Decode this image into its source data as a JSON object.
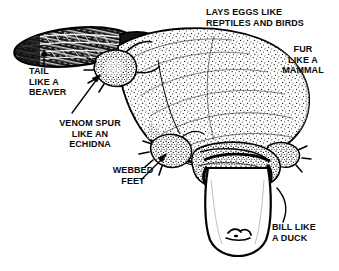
{
  "figure": {
    "view": "dorsal three-quarter view, head at lower right, tail at upper left",
    "style": "black and white stippled line drawing",
    "ink_color": "#000000",
    "background_color": "#ffffff"
  },
  "labels": [
    {
      "id": "lays-eggs",
      "name": "label-lays-eggs",
      "lines": [
        "LAYS EGGS LIKE",
        "REPTILES AND BIRDS"
      ],
      "text": "LAYS EGGS LIKE\nREPTILES AND BIRDS",
      "points_to": "body",
      "has_arrow": false
    },
    {
      "id": "fur",
      "name": "label-fur",
      "lines": [
        "FUR",
        "LIKE A",
        "MAMMAL"
      ],
      "text": "FUR\nLIKE A\nMAMMAL",
      "points_to": "body-fur",
      "has_arrow": false
    },
    {
      "id": "tail",
      "name": "label-tail",
      "lines": [
        "TAIL",
        "LIKE A",
        "BEAVER"
      ],
      "text": "TAIL\nLIKE A\nBEAVER",
      "points_to": "tail",
      "has_arrow": true
    },
    {
      "id": "venom-spur",
      "name": "label-venom-spur",
      "lines": [
        "VENOM SPUR",
        "LIKE AN",
        "ECHIDNA"
      ],
      "text": "VENOM SPUR\nLIKE AN\nECHIDNA",
      "points_to": "hind-limb-spur",
      "has_arrow": true
    },
    {
      "id": "webbed-feet",
      "name": "label-webbed-feet",
      "lines": [
        "WEBBED",
        "FEET"
      ],
      "text": "WEBBED\nFEET",
      "points_to": "front-foot",
      "has_arrow": true
    },
    {
      "id": "bill",
      "name": "label-bill",
      "lines": [
        "BILL LIKE",
        "A DUCK"
      ],
      "text": "BILL LIKE\nA DUCK",
      "points_to": "bill",
      "has_arrow": false
    }
  ],
  "anatomy_parts": [
    {
      "id": "tail",
      "label": "tail"
    },
    {
      "id": "body",
      "label": "body"
    },
    {
      "id": "hind-limb-spur",
      "label": "venom spur"
    },
    {
      "id": "front-foot",
      "label": "webbed foot"
    },
    {
      "id": "head",
      "label": "head"
    },
    {
      "id": "bill",
      "label": "bill"
    }
  ]
}
